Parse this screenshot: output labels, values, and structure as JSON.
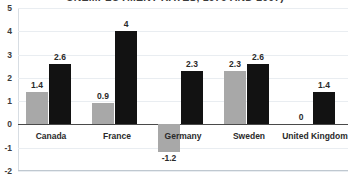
{
  "chart_data": {
    "type": "bar",
    "title": "UNEMPLOYMENT RATES, 1979 AND 2007)",
    "xlabel": "",
    "ylabel": "",
    "ylim": [
      -2,
      5
    ],
    "yticks": [
      "5",
      "4",
      "3",
      "2",
      "1",
      "0",
      "-1",
      "-2"
    ],
    "ytick_values": [
      5,
      4,
      3,
      2,
      1,
      0,
      -1,
      -2
    ],
    "grid": true,
    "legend": "none",
    "categories": [
      "Canada",
      "France",
      "Germany",
      "Sweden",
      "United Kingdom"
    ],
    "series": [
      {
        "name": "series-1",
        "color": "#a8a8a8",
        "values": [
          1.4,
          0.9,
          -1.2,
          2.3,
          0
        ],
        "labels": [
          "1.4",
          "0.9",
          "-1.2",
          "2.3",
          "0"
        ]
      },
      {
        "name": "series-2",
        "color": "#121212",
        "values": [
          2.6,
          4,
          2.3,
          2.6,
          1.4
        ],
        "labels": [
          "2.6",
          "4",
          "2.3",
          "2.6",
          "1.4"
        ]
      }
    ]
  }
}
